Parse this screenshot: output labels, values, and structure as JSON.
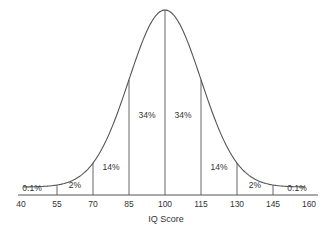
{
  "chart_data": {
    "type": "line",
    "title": "",
    "xlabel": "IQ Score",
    "ylabel": "",
    "x_ticks": [
      40,
      55,
      70,
      85,
      100,
      115,
      130,
      145,
      160
    ],
    "xlim": [
      40,
      160
    ],
    "distribution": {
      "mean": 100,
      "sd": 15
    },
    "grid": false,
    "legend": null,
    "regions": [
      {
        "from": 40,
        "to": 55,
        "label": "0.1%",
        "value": 0.1
      },
      {
        "from": 55,
        "to": 70,
        "label": "2%",
        "value": 2
      },
      {
        "from": 70,
        "to": 85,
        "label": "14%",
        "value": 14
      },
      {
        "from": 85,
        "to": 100,
        "label": "34%",
        "value": 34
      },
      {
        "from": 100,
        "to": 115,
        "label": "34%",
        "value": 34
      },
      {
        "from": 115,
        "to": 130,
        "label": "14%",
        "value": 14
      },
      {
        "from": 130,
        "to": 145,
        "label": "2%",
        "value": 2
      },
      {
        "from": 145,
        "to": 160,
        "label": "0.1%",
        "value": 0.1
      }
    ]
  },
  "style": {
    "line_color": "#555555",
    "text_color": "#333333",
    "background": "#ffffff"
  }
}
